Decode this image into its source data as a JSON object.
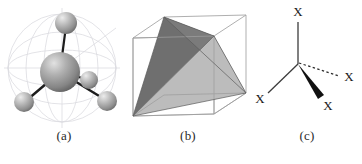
{
  "figure": {
    "background_color": "#ffffff",
    "width": 362,
    "height": 164
  },
  "panels": [
    {
      "id": "a",
      "caption": "(a)",
      "description": "ball-and-stick model of a tetrahedral AX4 molecule inside a faint wireframe sphere",
      "type": "ball-and-stick",
      "colors": {
        "sphere_light": "#d8d8d8",
        "sphere_mid": "#9a9a9a",
        "sphere_dark": "#6b6b6b",
        "bond": "#1c1c1c",
        "wireframe": "#d9d9de"
      },
      "atoms": [
        {
          "name": "central-atom",
          "cx": 60,
          "cy": 72,
          "r": 20,
          "role": "center"
        },
        {
          "name": "ligand-atom-top",
          "cx": 66,
          "cy": 23,
          "r": 11,
          "role": "ligand"
        },
        {
          "name": "ligand-atom-lower-left",
          "cx": 24,
          "cy": 102,
          "r": 10,
          "role": "ligand"
        },
        {
          "name": "ligand-atom-lower-right",
          "cx": 107,
          "cy": 101,
          "r": 10,
          "role": "ligand"
        },
        {
          "name": "ligand-atom-front",
          "cx": 89,
          "cy": 80,
          "r": 9,
          "role": "ligand"
        }
      ],
      "bonds": [
        {
          "name": "bond-center-top",
          "x1": 60,
          "y1": 72,
          "x2": 66,
          "y2": 26
        },
        {
          "name": "bond-center-lower-left",
          "x1": 60,
          "y1": 72,
          "x2": 27,
          "y2": 100
        },
        {
          "name": "bond-center-lower-right",
          "x1": 60,
          "y1": 72,
          "x2": 104,
          "y2": 99
        },
        {
          "name": "bond-center-front",
          "x1": 60,
          "y1": 72,
          "x2": 86,
          "y2": 79
        }
      ]
    },
    {
      "id": "b",
      "caption": "(b)",
      "description": "solid tetrahedron inscribed in a transparent wireframe cube",
      "type": "tetrahedron-in-cube",
      "colors": {
        "face_dark": "#6f6f6f",
        "face_mid": "#8d8d8d",
        "face_light": "#bcbcbc",
        "cube_edge": "#9a9a9a",
        "cube_edge_hidden": "#c2c2c2"
      },
      "cube_vertices": {
        "front_bottom_left": [
          11,
          116
        ],
        "front_bottom_right": [
          92,
          114
        ],
        "front_top_left": [
          11,
          38
        ],
        "front_top_right": [
          92,
          36
        ],
        "back_bottom_left": [
          42,
          95
        ],
        "back_bottom_right": [
          124,
          93
        ],
        "back_top_left": [
          42,
          17
        ],
        "back_top_right": [
          124,
          15
        ]
      },
      "tetra_vertices": {
        "apex_top": [
          42,
          17
        ],
        "right": [
          124,
          93
        ],
        "bottom_left": [
          11,
          116
        ],
        "inner": [
          92,
          36
        ]
      }
    },
    {
      "id": "c",
      "caption": "(c)",
      "description": "2D wedge-and-dash structural formula with four X substituents",
      "type": "wedge-dash-diagram",
      "colors": {
        "plain_bond": "#3c3c3c",
        "wedge_bond": "#111111",
        "dash_bond": "#2b2b2b",
        "label": "#1a1a1a"
      },
      "center": [
        46,
        64
      ],
      "substituents": [
        {
          "name": "substituent-up",
          "label": "X",
          "bond_style": "plain",
          "end": [
            46,
            20
          ],
          "label_pos": [
            46,
            16
          ]
        },
        {
          "name": "substituent-lower-left",
          "label": "X",
          "bond_style": "plain",
          "end": [
            15,
            94
          ],
          "label_pos": [
            9,
            101
          ]
        },
        {
          "name": "substituent-wedge-lower-right",
          "label": "X",
          "bond_style": "wedge",
          "end": [
            70,
            97
          ],
          "label_pos": [
            74,
            108
          ]
        },
        {
          "name": "substituent-dashed-right",
          "label": "X",
          "bond_style": "dashed",
          "end": [
            88,
            76
          ],
          "label_pos": [
            96,
            79
          ]
        }
      ]
    }
  ]
}
